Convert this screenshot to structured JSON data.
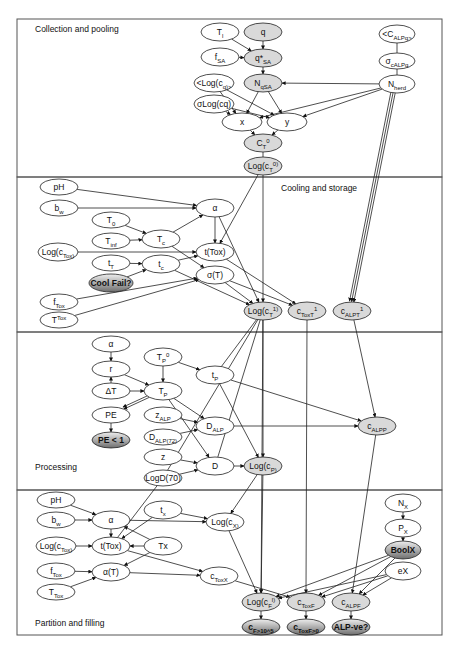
{
  "sections": [
    {
      "id": "collection",
      "label": "Collection and pooling",
      "label_x": 35,
      "label_y": 32,
      "box": [
        17,
        19,
        425,
        158
      ]
    },
    {
      "id": "cooling",
      "label": "Cooling and storage",
      "label_x": 281,
      "label_y": 191,
      "box": [
        17,
        177,
        425,
        155
      ]
    },
    {
      "id": "processing",
      "label": "Processing",
      "label_x": 35,
      "label_y": 470,
      "box": [
        17,
        332,
        425,
        158
      ]
    },
    {
      "id": "partition",
      "label": "Partition and filling",
      "label_x": 35,
      "label_y": 626,
      "box": [
        17,
        490,
        425,
        145
      ]
    }
  ],
  "colors": {
    "node_fill_plain": "#ffffff",
    "node_fill_gray": "#d9d9d9",
    "node_fill_dark_top": "#e6e6e6",
    "node_fill_dark_bottom": "#7a7a7a",
    "stroke": "#222222",
    "border": "#555555"
  },
  "nodes": [
    {
      "id": "Tl",
      "html": "T|l",
      "x": 220,
      "y": 32,
      "rx": 19,
      "ry": 9,
      "style": "plain"
    },
    {
      "id": "q",
      "html": "q",
      "x": 263,
      "y": 32,
      "rx": 19,
      "ry": 9,
      "style": "gray"
    },
    {
      "id": "fSA",
      "html": "f|SA",
      "x": 220,
      "y": 57,
      "rx": 19,
      "ry": 9,
      "style": "plain"
    },
    {
      "id": "qSA",
      "html": "q*|SA",
      "x": 263,
      "y": 58,
      "rx": 19,
      "ry": 9,
      "style": "gray"
    },
    {
      "id": "Logcq",
      "html": "<Log(c|q|)>",
      "x": 214,
      "y": 83,
      "rx": 20,
      "ry": 9,
      "style": "plain"
    },
    {
      "id": "NqSA",
      "html": "N|qSA",
      "x": 263,
      "y": 83,
      "rx": 19,
      "ry": 9,
      "style": "gray"
    },
    {
      "id": "sLogcq",
      "html": "σLog(cq)",
      "x": 214,
      "y": 104,
      "rx": 20,
      "ry": 9,
      "style": "plain"
    },
    {
      "id": "x",
      "html": "x",
      "x": 242,
      "y": 122,
      "rx": 20,
      "ry": 9,
      "style": "plain"
    },
    {
      "id": "y",
      "html": "y",
      "x": 287,
      "y": 122,
      "rx": 20,
      "ry": 9,
      "style": "plain"
    },
    {
      "id": "CT0",
      "html": "C|T|^0",
      "x": 263,
      "y": 143,
      "rx": 19,
      "ry": 9,
      "style": "gray"
    },
    {
      "id": "LogcT0",
      "html": "Log(c|T|^0)",
      "x": 263,
      "y": 166,
      "rx": 19,
      "ry": 9,
      "style": "gray"
    },
    {
      "id": "CALPq",
      "html": "<C|ALPq|>",
      "x": 397,
      "y": 34,
      "rx": 18,
      "ry": 9,
      "style": "plain"
    },
    {
      "id": "sALPq",
      "html": "σ|cALPq",
      "x": 397,
      "y": 61,
      "rx": 18,
      "ry": 8,
      "style": "plain"
    },
    {
      "id": "Nherd",
      "html": "N|herd",
      "x": 397,
      "y": 84,
      "rx": 18,
      "ry": 9,
      "style": "plain"
    },
    {
      "id": "pH1",
      "html": "pH",
      "x": 59,
      "y": 187,
      "rx": 19,
      "ry": 8,
      "style": "plain"
    },
    {
      "id": "bw1",
      "html": "b|w",
      "x": 59,
      "y": 208,
      "rx": 19,
      "ry": 8,
      "style": "plain"
    },
    {
      "id": "alpha1",
      "html": "α",
      "x": 215,
      "y": 208,
      "rx": 19,
      "ry": 9,
      "style": "plain"
    },
    {
      "id": "T0",
      "html": "T|0",
      "x": 111,
      "y": 220,
      "rx": 19,
      "ry": 8,
      "style": "plain"
    },
    {
      "id": "Tinf",
      "html": "T|inf",
      "x": 111,
      "y": 241,
      "rx": 19,
      "ry": 8,
      "style": "plain"
    },
    {
      "id": "Tc",
      "html": "T|c",
      "x": 161,
      "y": 239,
      "rx": 19,
      "ry": 9,
      "style": "plain"
    },
    {
      "id": "LogcTox1",
      "html": "Log(c|Tox|)",
      "x": 58,
      "y": 252,
      "rx": 20,
      "ry": 9,
      "style": "plain"
    },
    {
      "id": "tTox1",
      "html": "t(Tox)",
      "x": 215,
      "y": 252,
      "rx": 19,
      "ry": 9,
      "style": "plain"
    },
    {
      "id": "tT",
      "html": "t|T",
      "x": 111,
      "y": 263,
      "rx": 19,
      "ry": 8,
      "style": "plain"
    },
    {
      "id": "tc",
      "html": "t|c",
      "x": 161,
      "y": 264,
      "rx": 19,
      "ry": 9,
      "style": "plain"
    },
    {
      "id": "sigmaT",
      "html": "σ(T)",
      "x": 215,
      "y": 275,
      "rx": 19,
      "ry": 9,
      "style": "plain"
    },
    {
      "id": "CoolFail",
      "html": "Cool Fail?",
      "x": 111,
      "y": 283,
      "rx": 22,
      "ry": 9,
      "style": "dark"
    },
    {
      "id": "fTox1",
      "html": "f|Tox",
      "x": 59,
      "y": 302,
      "rx": 19,
      "ry": 8,
      "style": "plain"
    },
    {
      "id": "TTox1",
      "html": "T|^Tox",
      "x": 59,
      "y": 320,
      "rx": 19,
      "ry": 8,
      "style": "plain"
    },
    {
      "id": "LogcT1",
      "html": "Log(c|T|^1)",
      "x": 263,
      "y": 311,
      "rx": 19,
      "ry": 9,
      "style": "gray"
    },
    {
      "id": "cToxT1",
      "html": "c|ToxT|^1",
      "x": 307,
      "y": 311,
      "rx": 19,
      "ry": 9,
      "style": "gray"
    },
    {
      "id": "cALPT1",
      "html": "c|ALPT|^1",
      "x": 352,
      "y": 311,
      "rx": 19,
      "ry": 9,
      "style": "gray"
    },
    {
      "id": "alpha2",
      "html": "α",
      "x": 111,
      "y": 344,
      "rx": 19,
      "ry": 8,
      "style": "plain"
    },
    {
      "id": "TP0",
      "html": "T|P|^0",
      "x": 163,
      "y": 357,
      "rx": 19,
      "ry": 9,
      "style": "plain"
    },
    {
      "id": "r",
      "html": "r",
      "x": 111,
      "y": 369,
      "rx": 19,
      "ry": 8,
      "style": "plain"
    },
    {
      "id": "tP",
      "html": "t|P",
      "x": 215,
      "y": 375,
      "rx": 19,
      "ry": 9,
      "style": "plain"
    },
    {
      "id": "dT",
      "html": "ΔT",
      "x": 111,
      "y": 391,
      "rx": 19,
      "ry": 8,
      "style": "plain"
    },
    {
      "id": "TP",
      "html": "T|P",
      "x": 163,
      "y": 391,
      "rx": 19,
      "ry": 9,
      "style": "plain"
    },
    {
      "id": "PE",
      "html": "PE",
      "x": 111,
      "y": 415,
      "rx": 19,
      "ry": 8,
      "style": "plain"
    },
    {
      "id": "zALP",
      "html": "z|ALP",
      "x": 163,
      "y": 415,
      "rx": 19,
      "ry": 8,
      "style": "plain"
    },
    {
      "id": "DALP",
      "html": "D|ALP",
      "x": 215,
      "y": 426,
      "rx": 19,
      "ry": 9,
      "style": "plain"
    },
    {
      "id": "cALPP",
      "html": "c|ALPP",
      "x": 377,
      "y": 426,
      "rx": 19,
      "ry": 9,
      "style": "gray"
    },
    {
      "id": "PElt1",
      "html": "PE < 1",
      "x": 111,
      "y": 440,
      "rx": 19,
      "ry": 8,
      "style": "dark"
    },
    {
      "id": "DALP72",
      "html": "D|ALP|(72)",
      "x": 163,
      "y": 437,
      "rx": 19,
      "ry": 8,
      "style": "plain"
    },
    {
      "id": "z",
      "html": "z",
      "x": 163,
      "y": 457,
      "rx": 19,
      "ry": 8,
      "style": "plain"
    },
    {
      "id": "D",
      "html": "D",
      "x": 215,
      "y": 466,
      "rx": 19,
      "ry": 9,
      "style": "plain"
    },
    {
      "id": "LogcP",
      "html": "Log(c|P|)",
      "x": 263,
      "y": 466,
      "rx": 19,
      "ry": 9,
      "style": "gray"
    },
    {
      "id": "LogD70",
      "html": "LogD(70)",
      "x": 163,
      "y": 478,
      "rx": 19,
      "ry": 8,
      "style": "plain"
    },
    {
      "id": "pH2",
      "html": "pH",
      "x": 56,
      "y": 500,
      "rx": 19,
      "ry": 8,
      "style": "plain"
    },
    {
      "id": "tx",
      "html": "t|x",
      "x": 163,
      "y": 510,
      "rx": 19,
      "ry": 9,
      "style": "plain"
    },
    {
      "id": "bw2",
      "html": "b|w",
      "x": 56,
      "y": 520,
      "rx": 19,
      "ry": 8,
      "style": "plain"
    },
    {
      "id": "alpha3",
      "html": "α",
      "x": 111,
      "y": 520,
      "rx": 19,
      "ry": 9,
      "style": "plain"
    },
    {
      "id": "LogcX",
      "html": "Log(c|X|)",
      "x": 225,
      "y": 522,
      "rx": 19,
      "ry": 9,
      "style": "plain"
    },
    {
      "id": "NX",
      "html": "N|X",
      "x": 403,
      "y": 503,
      "rx": 18,
      "ry": 9,
      "style": "plain"
    },
    {
      "id": "PX",
      "html": "P|X",
      "x": 403,
      "y": 528,
      "rx": 18,
      "ry": 9,
      "style": "plain"
    },
    {
      "id": "LogcTox2",
      "html": "Log(c|Tox|)",
      "x": 56,
      "y": 546,
      "rx": 20,
      "ry": 9,
      "style": "plain"
    },
    {
      "id": "tTox2",
      "html": "t(Tox)",
      "x": 111,
      "y": 546,
      "rx": 19,
      "ry": 9,
      "style": "plain"
    },
    {
      "id": "Tx",
      "html": "Tx",
      "x": 163,
      "y": 546,
      "rx": 19,
      "ry": 9,
      "style": "plain"
    },
    {
      "id": "BoolX",
      "html": "BoolX",
      "x": 403,
      "y": 550,
      "rx": 18,
      "ry": 9,
      "style": "dark"
    },
    {
      "id": "fTox2",
      "html": "f|Tox",
      "x": 56,
      "y": 571,
      "rx": 19,
      "ry": 8,
      "style": "plain"
    },
    {
      "id": "alphaT",
      "html": "α(T)",
      "x": 111,
      "y": 572,
      "rx": 19,
      "ry": 9,
      "style": "plain"
    },
    {
      "id": "cToxX",
      "html": "c|ToxX",
      "x": 219,
      "y": 576,
      "rx": 19,
      "ry": 9,
      "style": "plain"
    },
    {
      "id": "eX",
      "html": "eX",
      "x": 403,
      "y": 571,
      "rx": 18,
      "ry": 9,
      "style": "plain"
    },
    {
      "id": "TTox2",
      "html": "T|Tox",
      "x": 56,
      "y": 592,
      "rx": 19,
      "ry": 8,
      "style": "plain"
    },
    {
      "id": "LogcF",
      "html": "Log(c|F|^l)",
      "x": 261,
      "y": 602,
      "rx": 19,
      "ry": 9,
      "style": "gray"
    },
    {
      "id": "cToxF",
      "html": "c|ToxF",
      "x": 306,
      "y": 602,
      "rx": 19,
      "ry": 9,
      "style": "gray"
    },
    {
      "id": "cALPF",
      "html": "c|ALPF",
      "x": 351,
      "y": 602,
      "rx": 19,
      "ry": 9,
      "style": "gray"
    },
    {
      "id": "cFgt",
      "html": "c|F|>10^5",
      "x": 261,
      "y": 627,
      "rx": 19,
      "ry": 8,
      "style": "dark"
    },
    {
      "id": "cToxFgt",
      "html": "c|ToxF|>0",
      "x": 306,
      "y": 627,
      "rx": 19,
      "ry": 8,
      "style": "dark"
    },
    {
      "id": "ALPve",
      "html": "ALP-ve?",
      "x": 351,
      "y": 627,
      "rx": 19,
      "ry": 8,
      "style": "dark"
    }
  ],
  "edges": [
    [
      "Tl",
      "qSA"
    ],
    [
      "q",
      "qSA"
    ],
    [
      "fSA",
      "qSA"
    ],
    [
      "qSA",
      "NqSA"
    ],
    [
      "Nherd",
      "NqSA"
    ],
    [
      "NqSA",
      "x"
    ],
    [
      "NqSA",
      "y"
    ],
    [
      "Logcq",
      "x"
    ],
    [
      "Logcq",
      "y"
    ],
    [
      "sLogcq",
      "x"
    ],
    [
      "sLogcq",
      "y"
    ],
    [
      "Nherd",
      "x"
    ],
    [
      "Nherd",
      "y"
    ],
    [
      "x",
      "CT0"
    ],
    [
      "y",
      "CT0"
    ],
    [
      "CT0",
      "LogcT0",
      0
    ],
    [
      "CALPq",
      "sALPq",
      0
    ],
    [
      "sALPq",
      "Nherd",
      0
    ],
    [
      "Nherd",
      "cALPT1"
    ],
    [
      "Nherd",
      "cALPT1"
    ],
    [
      "Nherd",
      "cALPT1"
    ],
    [
      "pH1",
      "alpha1"
    ],
    [
      "bw1",
      "alpha1"
    ],
    [
      "T0",
      "Tc"
    ],
    [
      "Tinf",
      "Tc"
    ],
    [
      "Tc",
      "alpha1"
    ],
    [
      "Tc",
      "sigmaT"
    ],
    [
      "LogcTox1",
      "tTox1"
    ],
    [
      "tT",
      "tc"
    ],
    [
      "CoolFail",
      "tc"
    ],
    [
      "tc",
      "tTox1"
    ],
    [
      "tc",
      "LogcT1"
    ],
    [
      "fTox1",
      "sigmaT"
    ],
    [
      "TTox1",
      "sigmaT"
    ],
    [
      "alpha1",
      "tTox1"
    ],
    [
      "alpha1",
      "LogcT1"
    ],
    [
      "LogcT0",
      "tTox1"
    ],
    [
      "LogcT0",
      "LogcT1"
    ],
    [
      "tTox1",
      "cToxT1"
    ],
    [
      "sigmaT",
      "cToxT1"
    ],
    [
      "sigmaT",
      "LogcT1"
    ],
    [
      "alpha2",
      "r"
    ],
    [
      "dT",
      "r"
    ],
    [
      "r",
      "TP"
    ],
    [
      "dT",
      "TP"
    ],
    [
      "TP0",
      "TP"
    ],
    [
      "TP0",
      "tP"
    ],
    [
      "TP",
      "PE"
    ],
    [
      "TP",
      "PE"
    ],
    [
      "PE",
      "PElt1"
    ],
    [
      "TP",
      "DALP"
    ],
    [
      "TP",
      "D"
    ],
    [
      "zALP",
      "DALP"
    ],
    [
      "DALP72",
      "DALP"
    ],
    [
      "z",
      "D"
    ],
    [
      "LogD70",
      "D"
    ],
    [
      "tP",
      "LogcP"
    ],
    [
      "tP",
      "cALPP"
    ],
    [
      "DALP",
      "cALPP"
    ],
    [
      "D",
      "LogcP"
    ],
    [
      "LogcT1",
      "LogcP"
    ],
    [
      "LogcT1",
      "tP",
      0
    ],
    [
      "LogcT1",
      "D",
      0
    ],
    [
      "LogcT1",
      "LogD70",
      0
    ],
    [
      "cALPT1",
      "cALPP"
    ],
    [
      "pH2",
      "alpha3"
    ],
    [
      "bw2",
      "alpha3"
    ],
    [
      "alpha3",
      "LogcX"
    ],
    [
      "tx",
      "LogcX"
    ],
    [
      "alpha3",
      "tTox2"
    ],
    [
      "tx",
      "tTox2"
    ],
    [
      "Tx",
      "tTox2"
    ],
    [
      "Tx",
      "alpha3"
    ],
    [
      "LogcTox2",
      "tTox2"
    ],
    [
      "fTox2",
      "alphaT"
    ],
    [
      "TTox2",
      "alphaT"
    ],
    [
      "Tx",
      "alphaT"
    ],
    [
      "alphaT",
      "cToxX"
    ],
    [
      "tTox2",
      "cToxX"
    ],
    [
      "LogcP",
      "LogcX"
    ],
    [
      "LogD70",
      "tTox2",
      0
    ],
    [
      "NX",
      "PX"
    ],
    [
      "PX",
      "BoolX"
    ],
    [
      "LogcX",
      "LogcF"
    ],
    [
      "cToxX",
      "cToxF"
    ],
    [
      "LogcP",
      "LogcF"
    ],
    [
      "cToxT1",
      "cToxF"
    ],
    [
      "cALPP",
      "cALPF"
    ],
    [
      "BoolX",
      "LogcF"
    ],
    [
      "BoolX",
      "cToxF"
    ],
    [
      "BoolX",
      "cALPF"
    ],
    [
      "eX",
      "LogcF"
    ],
    [
      "eX",
      "cToxF"
    ],
    [
      "eX",
      "cALPF"
    ],
    [
      "LogcT1",
      "LogcF"
    ],
    [
      "LogcF",
      "cFgt"
    ],
    [
      "cToxF",
      "cToxFgt"
    ],
    [
      "cALPF",
      "ALPve"
    ]
  ]
}
